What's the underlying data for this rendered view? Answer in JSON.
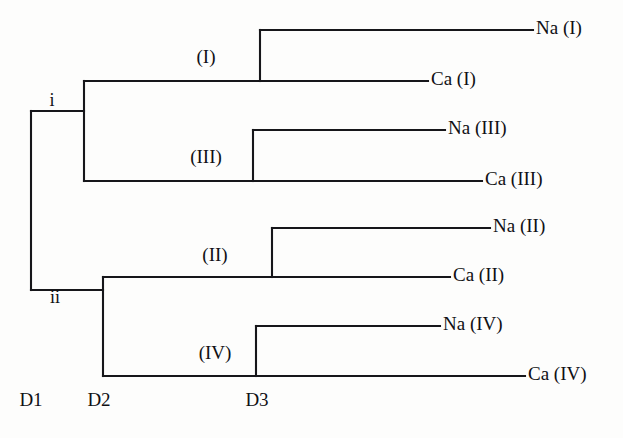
{
  "figure": {
    "kind": "dendrogram",
    "background_color": "#fdfdfc",
    "line_color": "#16161a",
    "text_color": "#101014"
  },
  "chart_data": {
    "type": "diagram",
    "title": "",
    "orientation": "horizontal-right",
    "leaves": [
      {
        "id": "leaf-na-1",
        "label": "Na (I)",
        "y": 30,
        "line_start_x": 260,
        "line_end_x": 533,
        "text_x": 536
      },
      {
        "id": "leaf-ca-1",
        "label": "Ca (I)",
        "y": 81,
        "line_start_x": 260,
        "line_end_x": 428,
        "text_x": 431
      },
      {
        "id": "leaf-na-3",
        "label": "Na (III)",
        "y": 130,
        "line_start_x": 253,
        "line_end_x": 445,
        "text_x": 448
      },
      {
        "id": "leaf-ca-3",
        "label": "Ca (III)",
        "y": 181,
        "line_start_x": 253,
        "line_end_x": 482,
        "text_x": 485
      },
      {
        "id": "leaf-na-2",
        "label": "Na (II)",
        "y": 228,
        "line_start_x": 272,
        "line_end_x": 490,
        "text_x": 493
      },
      {
        "id": "leaf-ca-2",
        "label": "Ca (II)",
        "y": 277,
        "line_start_x": 272,
        "line_end_x": 450,
        "text_x": 453
      },
      {
        "id": "leaf-na-4",
        "label": "Na (IV)",
        "y": 326,
        "line_start_x": 256,
        "line_end_x": 440,
        "text_x": 443
      },
      {
        "id": "leaf-ca-4",
        "label": "Ca (IV)",
        "y": 376,
        "line_start_x": 256,
        "line_end_x": 525,
        "text_x": 528
      }
    ],
    "internal_nodes": [
      {
        "id": "node-clade-1",
        "label": "(I)",
        "x": 260,
        "y_top": 30,
        "y_bottom": 81,
        "stem_from_x": 84,
        "stem_y": 81,
        "label_x": 206,
        "label_y": 63
      },
      {
        "id": "node-clade-3",
        "label": "(III)",
        "x": 253,
        "y_top": 130,
        "y_bottom": 181,
        "stem_from_x": 84,
        "stem_y": 181,
        "label_x": 206,
        "label_y": 163
      },
      {
        "id": "node-clade-2",
        "label": "(II)",
        "x": 272,
        "y_top": 228,
        "y_bottom": 277,
        "stem_from_x": 103,
        "stem_y": 277,
        "label_x": 215,
        "label_y": 261
      },
      {
        "id": "node-clade-4",
        "label": "(IV)",
        "x": 256,
        "y_top": 326,
        "y_bottom": 376,
        "stem_from_x": 103,
        "stem_y": 376,
        "label_x": 215,
        "label_y": 359
      }
    ],
    "group_nodes": [
      {
        "id": "node-group-i",
        "label": "i",
        "x": 84,
        "y_top": 81,
        "y_bottom": 181,
        "stem_from_x": 31,
        "stem_y": 111,
        "label_x": 52,
        "label_y": 106
      },
      {
        "id": "node-group-ii",
        "label": "ii",
        "x": 103,
        "y_top": 277,
        "y_bottom": 376,
        "stem_from_x": 31,
        "stem_y": 290,
        "label_x": 55,
        "label_y": 303
      }
    ],
    "root": {
      "id": "node-root",
      "x": 31,
      "y_top": 111,
      "y_bottom": 290
    },
    "distance_axis": {
      "ticks": [
        {
          "id": "tick-d1",
          "label": "D1",
          "x": 31
        },
        {
          "id": "tick-d2",
          "label": "D2",
          "x": 99
        },
        {
          "id": "tick-d3",
          "label": "D3",
          "x": 257
        }
      ],
      "label_y": 406
    }
  }
}
